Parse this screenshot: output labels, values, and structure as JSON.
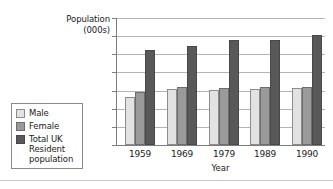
{
  "chart_data": {
    "type": "bar",
    "title": "",
    "xlabel": "Year",
    "ylabel": "Population\n(000s)",
    "categories": [
      "1959",
      "1969",
      "1979",
      "1989",
      "1990"
    ],
    "series": [
      {
        "name": "Male",
        "color": "#e2e2e2",
        "values": [
          26500,
          30800,
          30400,
          30700,
          31400
        ]
      },
      {
        "name": "Female",
        "color": "#9a9a9a",
        "values": [
          29400,
          31800,
          31500,
          32100,
          32200
        ]
      },
      {
        "name": "Total UK\nResident\npopulation",
        "color": "#595959",
        "values": [
          52600,
          54600,
          58000,
          57800,
          60500
        ]
      }
    ],
    "ylim": [
      0,
      70000
    ],
    "ytick_labels": [
      "70000",
      "60000",
      "50000",
      "40000",
      "30000",
      "20000",
      "10000",
      "0"
    ],
    "ytick_values": [
      70000,
      60000,
      50000,
      40000,
      30000,
      20000,
      10000,
      0
    ],
    "grid": true,
    "legend_position": "left"
  },
  "legend": {
    "items": [
      {
        "label": "Male"
      },
      {
        "label": "Female"
      },
      {
        "label": "Total UK\nResident\npopulation"
      }
    ]
  }
}
